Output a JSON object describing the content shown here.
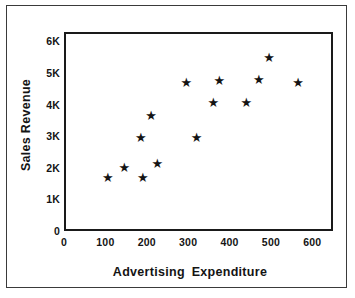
{
  "chart_data": {
    "type": "scatter",
    "title": "",
    "xlabel": "Advertising  Expenditure",
    "ylabel": "Sales Revenue",
    "xlim": [
      0,
      650
    ],
    "ylim": [
      0,
      6300
    ],
    "grid": false,
    "legend": null,
    "marker": "star",
    "marker_color": "#141414",
    "xticks": [
      0,
      100,
      200,
      300,
      400,
      500,
      600
    ],
    "xticklabels": [
      "0",
      "100",
      "200",
      "300",
      "400",
      "500",
      "600"
    ],
    "yticks": [
      0,
      1000,
      2000,
      3000,
      4000,
      5000,
      6000
    ],
    "yticklabels": [
      "0",
      "1K",
      "2K",
      "3K",
      "4K",
      "5K",
      "6K"
    ],
    "points": [
      {
        "x": 100,
        "y": 1750
      },
      {
        "x": 140,
        "y": 2050
      },
      {
        "x": 180,
        "y": 3000
      },
      {
        "x": 185,
        "y": 1750
      },
      {
        "x": 205,
        "y": 3700
      },
      {
        "x": 220,
        "y": 2200
      },
      {
        "x": 290,
        "y": 4750
      },
      {
        "x": 315,
        "y": 3000
      },
      {
        "x": 355,
        "y": 4100
      },
      {
        "x": 370,
        "y": 4800
      },
      {
        "x": 435,
        "y": 4100
      },
      {
        "x": 465,
        "y": 4850
      },
      {
        "x": 490,
        "y": 5550
      },
      {
        "x": 560,
        "y": 4750
      }
    ],
    "marker_glyph": "★"
  }
}
